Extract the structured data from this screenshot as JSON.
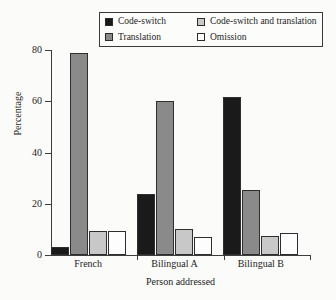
{
  "chart_data": {
    "type": "bar",
    "title": "",
    "xlabel": "Person addressed",
    "ylabel": "Percentage",
    "categories": [
      "French",
      "Bilingual A",
      "Bilingual B"
    ],
    "yticks": [
      0,
      20,
      40,
      60,
      80
    ],
    "ylim": [
      0,
      80
    ],
    "grid": false,
    "legend_position": "top",
    "series": [
      {
        "name": "Code-switch",
        "color": "#1a1a1a",
        "values": [
          3,
          24,
          61.5
        ]
      },
      {
        "name": "Translation",
        "color": "#8a8a8a",
        "values": [
          79,
          60,
          25.5
        ]
      },
      {
        "name": "Code-switch and translation",
        "color": "#c8c8c8",
        "values": [
          9.5,
          10,
          7.5
        ]
      },
      {
        "name": "Omission",
        "color": "#fdfdfd",
        "values": [
          9.5,
          7,
          8.5
        ]
      }
    ],
    "legend_order": [
      {
        "name": "Code-switch",
        "color": "#1a1a1a"
      },
      {
        "name": "Code-switch and translation",
        "color": "#c8c8c8"
      },
      {
        "name": "Translation",
        "color": "#8a8a8a"
      },
      {
        "name": "Omission",
        "color": "#fdfdfd"
      }
    ]
  }
}
